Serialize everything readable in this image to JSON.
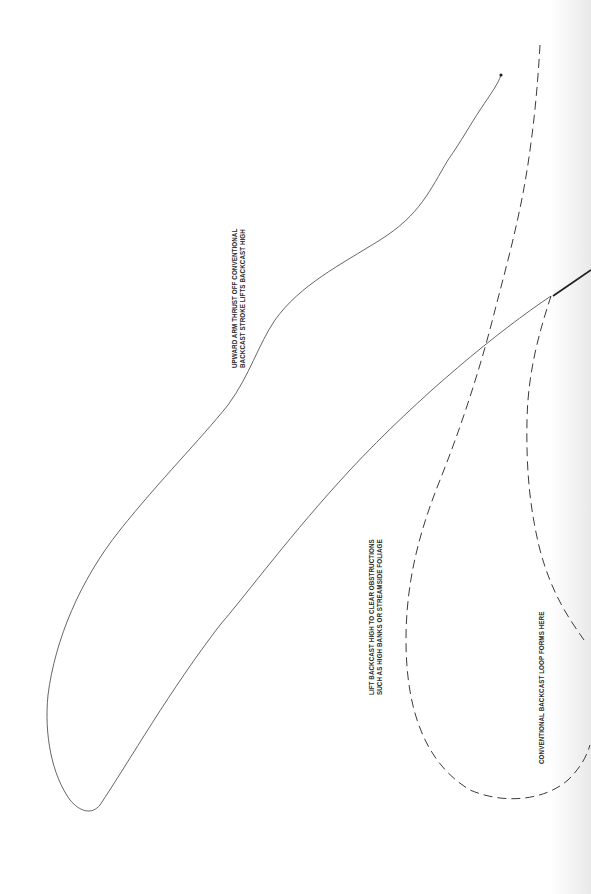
{
  "diagram": {
    "colors": {
      "background": "#ffffff",
      "line": "#2f2f2f",
      "thin_line": "#555555",
      "dashed_line": "#3a3a3a",
      "text": "#2a2a2a"
    },
    "labels": {
      "upward_thrust": {
        "line1": "UPWARD ARM THRUST OFF CONVENTIONAL",
        "line2": "BACKCAST STROKE LIFTS BACKCAST HIGH"
      },
      "lift_backcast": {
        "line1": "LIFT BACKCAST HIGH TO CLEAR OBSTRUCTIONS",
        "line2": "SUCH AS HIGH BANKS OR STREAMSIDE FOLIAGE"
      },
      "conventional_loop": {
        "line1": "CONVENTIONAL BACKCAST LOOP FORMS HERE"
      }
    },
    "paths": {
      "high_backcast_line": "M551,296 C500,330 420,395 350,470 C290,535 250,590 220,625 C170,690 130,760 100,805 C92,815 80,812 70,800 C52,775 44,735 48,695 C55,640 80,580 120,530 C160,480 200,440 228,405 C250,375 258,345 275,320 C300,285 340,265 380,240 C420,215 430,190 448,160 C462,140 470,125 480,110 C492,92 498,84 501,75",
      "rod": "M553,296 L591,270",
      "conventional_backcast_dashed": "M540,45 C538,80 535,115 530,150 C522,210 508,260 495,310 C480,370 460,430 440,480 C420,530 406,580 406,640 C406,700 420,760 470,790 C505,805 545,800 568,780 C580,768 586,758 590,745",
      "conventional_loop_dashed": "M551,296 C540,330 528,370 527,420 C526,470 530,510 540,550 C552,595 570,620 584,640",
      "line_end_dot": {
        "cx": 501,
        "cy": 75,
        "r": 1.6
      }
    }
  }
}
